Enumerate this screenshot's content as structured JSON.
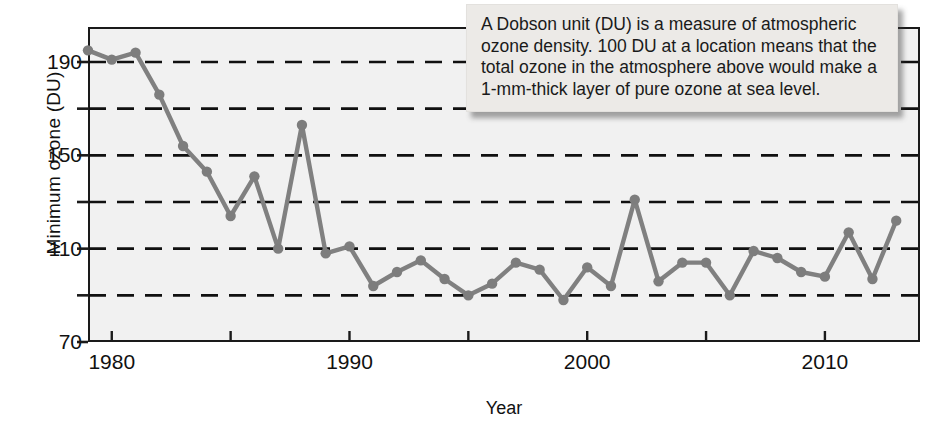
{
  "figure": {
    "annotation": {
      "text": "A Dobson unit (DU) is a measure of atmospheric ozone density. 100 DU at a location means that the total ozone in the atmosphere above would make a 1-mm-thick layer of pure ozone at sea level."
    },
    "colors": {
      "line": "#808080",
      "marker": "#7d7d7d",
      "plot_background": "#f1f1f1",
      "axis": "#1a1a1a",
      "gridline": "#101010",
      "callout_background": "#eceae7"
    }
  },
  "chart_data": {
    "type": "line",
    "title": "",
    "xlabel": "Year",
    "ylabel": "Minimum ozone (DU)",
    "xlim": [
      1979,
      2014
    ],
    "ylim": [
      70,
      205
    ],
    "grid": true,
    "gridlines_y": [
      90,
      110,
      130,
      150,
      170,
      190
    ],
    "legend": "none",
    "xticks_major": [
      1980,
      1990,
      2000,
      2010
    ],
    "xticks_minor": [
      1985,
      1995,
      2005
    ],
    "xtick_labels": [
      "1980",
      "1990",
      "2000",
      "2010"
    ],
    "yticks_major": [
      70,
      110,
      150,
      190
    ],
    "yticks_minor": [
      90,
      130,
      170
    ],
    "ytick_labels": [
      "70",
      "110",
      "150",
      "190"
    ],
    "x": [
      1979,
      1980,
      1981,
      1982,
      1983,
      1984,
      1985,
      1986,
      1987,
      1988,
      1989,
      1990,
      1991,
      1992,
      1993,
      1994,
      1995,
      1996,
      1997,
      1998,
      1999,
      2000,
      2001,
      2002,
      2003,
      2004,
      2005,
      2006,
      2007,
      2008,
      2009,
      2010,
      2011,
      2012,
      2013
    ],
    "values": [
      195,
      191,
      194,
      176,
      154,
      143,
      124,
      141,
      110,
      163,
      108,
      111,
      94,
      100,
      105,
      97,
      90,
      95,
      104,
      101,
      88,
      102,
      94,
      131,
      96,
      104,
      104,
      90,
      109,
      106,
      100,
      98,
      117,
      97,
      122
    ],
    "series": [
      {
        "name": "Minimum ozone",
        "values": [
          195,
          191,
          194,
          176,
          154,
          143,
          124,
          141,
          110,
          163,
          108,
          111,
          94,
          100,
          105,
          97,
          90,
          95,
          104,
          101,
          88,
          102,
          94,
          131,
          96,
          104,
          104,
          90,
          109,
          106,
          100,
          98,
          117,
          97,
          122
        ]
      }
    ]
  }
}
